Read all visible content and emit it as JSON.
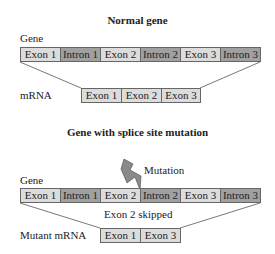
{
  "normal": {
    "title": "Normal gene",
    "gene_label": "Gene",
    "mrna_label": "mRNA",
    "gene_segments": [
      {
        "label": "Exon 1",
        "type": "exon"
      },
      {
        "label": "Intron 1",
        "type": "intron"
      },
      {
        "label": "Exon 2",
        "type": "exon"
      },
      {
        "label": "Intron 2",
        "type": "intron"
      },
      {
        "label": "Exon 3",
        "type": "exon"
      },
      {
        "label": "Intron 3",
        "type": "intron"
      }
    ],
    "mrna_segments": [
      {
        "label": "Exon 1",
        "type": "exon"
      },
      {
        "label": "Exon 2",
        "type": "exon"
      },
      {
        "label": "Exon 3",
        "type": "exon"
      }
    ]
  },
  "mutant": {
    "title": "Gene with splice site mutation",
    "gene_label": "Gene",
    "mutation_label": "Mutation",
    "skipped_label": "Exon 2 skipped",
    "mrna_label": "Mutant mRNA",
    "gene_segments": [
      {
        "label": "Exon 1",
        "type": "exon"
      },
      {
        "label": "Intron 1",
        "type": "intron"
      },
      {
        "label": "Exon 2",
        "type": "exon"
      },
      {
        "label": "Intron 2",
        "type": "intron"
      },
      {
        "label": "Exon 3",
        "type": "exon"
      },
      {
        "label": "Intron 3",
        "type": "intron"
      }
    ],
    "mrna_segments": [
      {
        "label": "Exon 1",
        "type": "exon"
      },
      {
        "label": "Exon 3",
        "type": "exon"
      }
    ]
  },
  "colors": {
    "exon": "#dcdcdc",
    "intron": "#a0a0a0",
    "border": "#666666",
    "bolt": "#8a8a8a"
  }
}
